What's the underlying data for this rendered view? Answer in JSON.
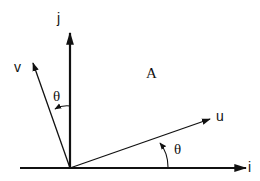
{
  "diagram": {
    "axes": {
      "horizontal": {
        "label": "i"
      },
      "vertical": {
        "label": "j"
      }
    },
    "vectors": [
      {
        "name": "u",
        "label": "u"
      },
      {
        "name": "v",
        "label": "v"
      }
    ],
    "angles": [
      {
        "between": "i-u",
        "label": "θ"
      },
      {
        "between": "j-v",
        "label": "θ"
      }
    ],
    "region_label": "A",
    "stroke_color": "#111111",
    "background": "#ffffff"
  }
}
